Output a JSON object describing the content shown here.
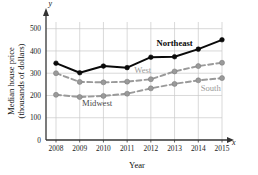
{
  "chart_data": {
    "type": "line",
    "title": "",
    "xlabel": "Year",
    "ylabel": "Median house price\n(thousands of dollars)",
    "ylabel_line1": "Median house price",
    "ylabel_line2": "(thousands of dollars)",
    "x_axis_var": "x",
    "y_axis_var": "y",
    "categories": [
      2008,
      2009,
      2010,
      2011,
      2012,
      2013,
      2014,
      2015
    ],
    "xtick_labels": [
      "2008",
      "2009",
      "2010",
      "2011",
      "2012",
      "2013",
      "2014",
      "2015"
    ],
    "ytick_labels": [
      "0",
      "100",
      "200",
      "300",
      "400",
      "500"
    ],
    "ytick_values": [
      0,
      100,
      200,
      300,
      400,
      500
    ],
    "ylim": [
      0,
      530
    ],
    "grid": true,
    "legend": "inline-annotations",
    "series": [
      {
        "name": "Northeast",
        "label": "Northeast",
        "color": "#0a0a0a",
        "style": "solid",
        "marker": "circle",
        "values": [
          345,
          302,
          332,
          325,
          372,
          374,
          408,
          450
        ]
      },
      {
        "name": "West",
        "label": "West",
        "color": "#9a9a9a",
        "style": "dashed",
        "marker": "circle",
        "values": [
          300,
          261,
          259,
          262,
          273,
          308,
          332,
          347
        ]
      },
      {
        "name": "South",
        "label": "South",
        "color": "#9a9a9a",
        "style": "dashed",
        "marker": "circle",
        "values": [
          203,
          193,
          198,
          208,
          232,
          252,
          268,
          278
        ]
      },
      {
        "name": "Midwest",
        "label": "Midwest",
        "color": "#6e6e6e",
        "style": "dashed",
        "marker": "circle",
        "values": [
          203,
          193,
          198,
          208,
          232,
          252,
          268,
          278
        ]
      }
    ],
    "annotations": [
      {
        "text": "Northeast",
        "x": 2013,
        "y": 420,
        "color": "#0a0a0a"
      },
      {
        "text": "West",
        "x": 2011.3,
        "y": 300,
        "color": "#9a9a9a"
      },
      {
        "text": "South",
        "x": 2014.1,
        "y": 222,
        "color": "#9a9a9a"
      },
      {
        "text": "Midwest",
        "x": 2009.1,
        "y": 152,
        "color": "#4a4a4a"
      }
    ]
  }
}
